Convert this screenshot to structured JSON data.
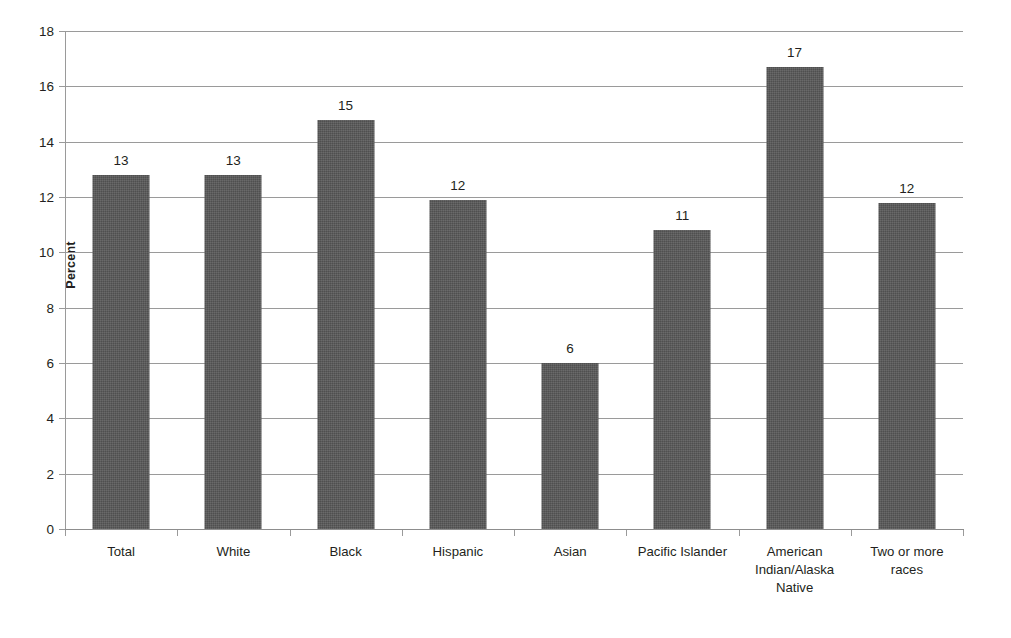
{
  "chart_data": {
    "type": "bar",
    "title": "",
    "xlabel": "",
    "ylabel": "Percent",
    "ylim": [
      0,
      18
    ],
    "y_ticks": [
      0,
      2,
      4,
      6,
      8,
      10,
      12,
      14,
      16,
      18
    ],
    "y_tick_labels": [
      "0",
      "2",
      "4",
      "6",
      "8",
      "10",
      "12",
      "14",
      "16",
      "18"
    ],
    "grid": true,
    "legend": "none",
    "categories": [
      "Total",
      "White",
      "Black",
      "Hispanic",
      "Asian",
      "Pacific Islander",
      "American Indian/Alaska Native",
      "Two or more races"
    ],
    "category_label_lines": [
      [
        "Total"
      ],
      [
        "White"
      ],
      [
        "Black"
      ],
      [
        "Hispanic"
      ],
      [
        "Asian"
      ],
      [
        "Pacific Islander"
      ],
      [
        "American",
        "Indian/Alaska",
        "Native"
      ],
      [
        "Two or more",
        "races"
      ]
    ],
    "values": [
      12.8,
      12.8,
      14.8,
      11.9,
      6.0,
      10.8,
      16.7,
      11.8
    ],
    "data_labels": [
      "13",
      "13",
      "15",
      "12",
      "6",
      "11",
      "17",
      "12"
    ],
    "bar_color": "#585858",
    "axis_color": "#9a9a9a",
    "text_color": "#231f20"
  }
}
